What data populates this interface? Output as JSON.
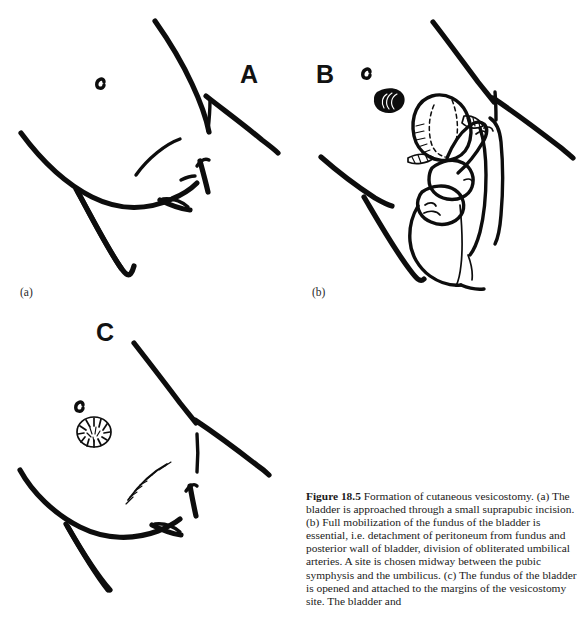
{
  "figure": {
    "number_label": "Figure 18.5",
    "title": "Formation of cutaneous vesicostomy.",
    "caption_body": "(a) The bladder is approached through a small suprapubic incision. (b) Full mobilization of the fundus of the bladder is essential, i.e. detachment of peritoneum from fundus and posterior wall of bladder, division of obliterated umbilical arteries. A site is chosen midway between the pubic symphysis and the umbilicus. (c) The fundus of the bladder is opened and attached to the margins of the vesicostomy site. The bladder and",
    "background_color": "#ffffff",
    "ink_color": "#0d0d0d"
  },
  "panels": [
    {
      "key": "a",
      "letter": "A",
      "sub_label": "(a)",
      "description": "Lower abdomen outline with umbilicus and planned suprapubic incision site",
      "features": [
        "abdominal-wall-contour",
        "umbilicus-mark",
        "inguinal-fold-left",
        "inguinal-fold-right",
        "suprapubic-incision-line"
      ]
    },
    {
      "key": "b",
      "letter": "B",
      "sub_label": "(b)",
      "description": "Surgeon's hand delivering the fully mobilized bladder fundus through the incision",
      "features": [
        "stoma-site-mark",
        "bladder-fundus",
        "bladder-dashed-outline",
        "surgeon-hand",
        "index-finger",
        "thumb",
        "inguinal-fold-left",
        "inguinal-fold-right"
      ]
    },
    {
      "key": "c",
      "letter": "C",
      "sub_label": "",
      "description": "Completed vesicostomy stoma with sutured suprapubic wound",
      "features": [
        "umbilicus-mark",
        "vesicostomy-stoma",
        "sutured-incision",
        "inguinal-fold-left",
        "inguinal-fold-right"
      ]
    }
  ]
}
